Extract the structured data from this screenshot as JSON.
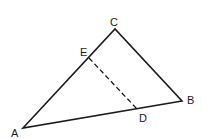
{
  "diagram": {
    "type": "triangle",
    "points": {
      "A": {
        "label": "A",
        "x": 23,
        "y": 128
      },
      "B": {
        "label": "B",
        "x": 182,
        "y": 101
      },
      "C": {
        "label": "C",
        "x": 115,
        "y": 29
      },
      "D": {
        "label": "D",
        "x": 137,
        "y": 109
      },
      "E": {
        "label": "E",
        "x": 89,
        "y": 58
      }
    },
    "segments": [
      {
        "from": "A",
        "to": "C",
        "style": "solid"
      },
      {
        "from": "C",
        "to": "B",
        "style": "solid"
      },
      {
        "from": "A",
        "to": "B",
        "style": "solid"
      },
      {
        "from": "E",
        "to": "D",
        "style": "dashed"
      }
    ],
    "colors": {
      "stroke": "#1a1a1a",
      "background": "#ffffff"
    }
  }
}
